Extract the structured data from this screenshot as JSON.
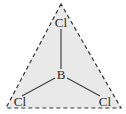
{
  "diagram": {
    "molecule": "BCl3",
    "geometry": "trigonal planar",
    "central_atom": {
      "label": "B",
      "x": 61,
      "y": 76
    },
    "terminal_atoms": [
      {
        "id": "cl-top",
        "label": "Cl",
        "x": 61,
        "y": 24
      },
      {
        "id": "cl-bottom-left",
        "label": "Cl",
        "x": 20,
        "y": 103
      },
      {
        "id": "cl-bottom-right",
        "label": "Cl",
        "x": 105,
        "y": 103
      }
    ],
    "bonds": [
      {
        "from": "B",
        "to": "cl-top",
        "x1": 61,
        "y1": 69,
        "x2": 61,
        "y2": 29
      },
      {
        "from": "B",
        "to": "cl-bottom-left",
        "x1": 55,
        "y1": 78,
        "x2": 22,
        "y2": 96
      },
      {
        "from": "B",
        "to": "cl-bottom-right",
        "x1": 67,
        "y1": 78,
        "x2": 100,
        "y2": 96
      }
    ],
    "outline": {
      "shape": "triangle",
      "style": "dashed",
      "points": "61,4 6,108 121,108"
    },
    "colors": {
      "fill": "#e9e9e9",
      "outline": "#333333",
      "bond": "#444444",
      "text": "#2a2a2a",
      "background": "#ffffff"
    }
  }
}
